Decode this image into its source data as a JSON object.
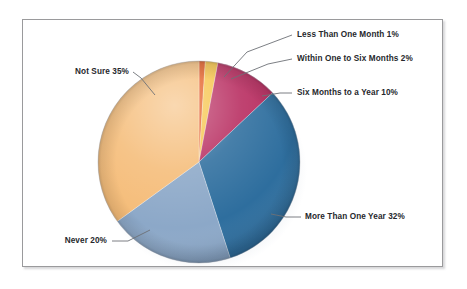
{
  "figure": {
    "background_color": "#ffffff",
    "frame_border_color": "#9a9a9c"
  },
  "chart_data": {
    "type": "pie",
    "title": "",
    "subtitle": "",
    "xlabel": "",
    "ylabel": "",
    "legend_position": "none",
    "grid": false,
    "label_format": "{name} {value}%",
    "units": "percent",
    "total": 100,
    "start_angle_deg": 0,
    "direction": "clockwise",
    "categories": [
      "Less Than One Month",
      "Within One to Six Months",
      "Six Months to a Year",
      "More Than One Year",
      "Never",
      "Not Sure"
    ],
    "values": [
      1,
      2,
      10,
      32,
      20,
      35
    ],
    "colors": [
      "#E2571B",
      "#F6C243",
      "#B72A5E",
      "#2E6E9E",
      "#8CA8C8",
      "#F5BC78"
    ],
    "slices": [
      {
        "name": "Less Than One Month",
        "value": 1,
        "label": "Less Than One Month 1%",
        "color": "#E2571B"
      },
      {
        "name": "Within One to Six Months",
        "value": 2,
        "label": "Within One to Six Months 2%",
        "color": "#F6C243"
      },
      {
        "name": "Six Months to a Year",
        "value": 10,
        "label": "Six Months to a Year 10%",
        "color": "#B72A5E"
      },
      {
        "name": "More Than One Year",
        "value": 32,
        "label": "More Than One Year 32%",
        "color": "#2E6E9E"
      },
      {
        "name": "Never",
        "value": 20,
        "label": "Never 20%",
        "color": "#8CA8C8"
      },
      {
        "name": "Not Sure",
        "value": 35,
        "label": "Not Sure 35%",
        "color": "#F5BC78"
      }
    ]
  }
}
